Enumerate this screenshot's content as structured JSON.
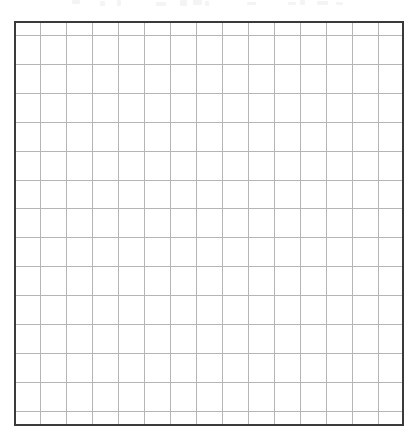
{
  "document": {
    "kind": "blank-grid-worksheet",
    "title": "Blank Grid Worksheet",
    "background_color": "#ffffff",
    "page_width_px": 417,
    "page_height_px": 439
  },
  "grid": {
    "name": "blank-grid",
    "columns": 15,
    "rows": 15,
    "cells_total": 225,
    "origin_x_px": 14,
    "origin_y_px": 21,
    "width_px": 390,
    "height_px": 405,
    "cell_width_px": 26,
    "cell_height_px": 27,
    "border_color": "#3a3a3a",
    "border_width_px": 2,
    "line_color": "#b5b5b5",
    "line_width_px": 1,
    "cell_fill_color": "#ffffff",
    "cell_values": [
      [
        "",
        "",
        "",
        "",
        "",
        "",
        "",
        "",
        "",
        "",
        "",
        "",
        "",
        "",
        ""
      ],
      [
        "",
        "",
        "",
        "",
        "",
        "",
        "",
        "",
        "",
        "",
        "",
        "",
        "",
        "",
        ""
      ],
      [
        "",
        "",
        "",
        "",
        "",
        "",
        "",
        "",
        "",
        "",
        "",
        "",
        "",
        "",
        ""
      ],
      [
        "",
        "",
        "",
        "",
        "",
        "",
        "",
        "",
        "",
        "",
        "",
        "",
        "",
        "",
        ""
      ],
      [
        "",
        "",
        "",
        "",
        "",
        "",
        "",
        "",
        "",
        "",
        "",
        "",
        "",
        "",
        ""
      ],
      [
        "",
        "",
        "",
        "",
        "",
        "",
        "",
        "",
        "",
        "",
        "",
        "",
        "",
        "",
        ""
      ],
      [
        "",
        "",
        "",
        "",
        "",
        "",
        "",
        "",
        "",
        "",
        "",
        "",
        "",
        "",
        ""
      ],
      [
        "",
        "",
        "",
        "",
        "",
        "",
        "",
        "",
        "",
        "",
        "",
        "",
        "",
        "",
        ""
      ],
      [
        "",
        "",
        "",
        "",
        "",
        "",
        "",
        "",
        "",
        "",
        "",
        "",
        "",
        "",
        ""
      ],
      [
        "",
        "",
        "",
        "",
        "",
        "",
        "",
        "",
        "",
        "",
        "",
        "",
        "",
        "",
        ""
      ],
      [
        "",
        "",
        "",
        "",
        "",
        "",
        "",
        "",
        "",
        "",
        "",
        "",
        "",
        "",
        ""
      ],
      [
        "",
        "",
        "",
        "",
        "",
        "",
        "",
        "",
        "",
        "",
        "",
        "",
        "",
        "",
        ""
      ],
      [
        "",
        "",
        "",
        "",
        "",
        "",
        "",
        "",
        "",
        "",
        "",
        "",
        "",
        "",
        ""
      ],
      [
        "",
        "",
        "",
        "",
        "",
        "",
        "",
        "",
        "",
        "",
        "",
        "",
        "",
        "",
        ""
      ],
      [
        "",
        "",
        "",
        "",
        "",
        "",
        "",
        "",
        "",
        "",
        "",
        "",
        "",
        "",
        ""
      ]
    ]
  },
  "scan_artifacts": {
    "description": "faint cut-off marks cropped at the top edge of the scan",
    "color": "#f4f4f6",
    "marks": [
      {
        "x": 72,
        "y": 0,
        "w": 8,
        "h": 4
      },
      {
        "x": 100,
        "y": 1,
        "w": 5,
        "h": 5
      },
      {
        "x": 117,
        "y": 0,
        "w": 4,
        "h": 6
      },
      {
        "x": 156,
        "y": 2,
        "w": 10,
        "h": 4
      },
      {
        "x": 180,
        "y": 0,
        "w": 7,
        "h": 6
      },
      {
        "x": 193,
        "y": 0,
        "w": 9,
        "h": 5
      },
      {
        "x": 205,
        "y": 1,
        "w": 4,
        "h": 5
      },
      {
        "x": 247,
        "y": 2,
        "w": 9,
        "h": 3
      },
      {
        "x": 288,
        "y": 2,
        "w": 8,
        "h": 3
      },
      {
        "x": 300,
        "y": 0,
        "w": 5,
        "h": 5
      },
      {
        "x": 317,
        "y": 1,
        "w": 11,
        "h": 4
      },
      {
        "x": 336,
        "y": 2,
        "w": 7,
        "h": 3
      }
    ]
  }
}
